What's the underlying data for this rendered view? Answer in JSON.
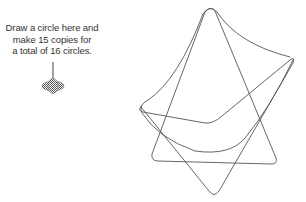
{
  "annotation": {
    "lines": [
      "Draw a circle here and",
      "make 15 copies for",
      "a total of 16 circles."
    ]
  },
  "colors": {
    "stroke": "#555555",
    "text": "#333333",
    "marker": "#666666"
  }
}
